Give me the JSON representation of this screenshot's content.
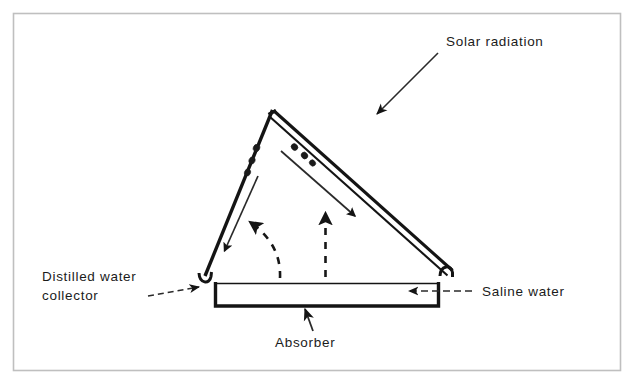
{
  "figure": {
    "kind": "technical-line-diagram",
    "background_color": "#ffffff",
    "ink_color": "#141414",
    "frame_color": "#bfbfbf",
    "width": 634,
    "height": 386
  },
  "labels": {
    "solar_radiation": "Solar radiation",
    "distilled_water_line1": "Distilled  water",
    "distilled_water_line2": "collector",
    "saline_water": "Saline water",
    "absorber": "Absorber"
  },
  "annotations": [
    {
      "name": "solar-radiation",
      "text": "Solar radiation",
      "text_x": 446,
      "text_y": 45,
      "leader": {
        "x1": 438,
        "y1": 53,
        "x2": 376,
        "y2": 115
      },
      "arrowhead": "end"
    },
    {
      "name": "distilled-water-collector",
      "text": "Distilled  water / collector",
      "text_x": 42,
      "text_y": 277,
      "leader": {
        "x1": 148,
        "y1": 295,
        "x2": 202,
        "y2": 285
      },
      "arrowhead": "end"
    },
    {
      "name": "saline-water",
      "text": "Saline water",
      "text_x": 481,
      "text_y": 295,
      "leader": {
        "x1": 470,
        "y1": 290,
        "x2": 410,
        "y2": 290
      },
      "arrowhead": "end"
    },
    {
      "name": "absorber",
      "text": "Absorber",
      "text_x": 276,
      "text_y": 342,
      "leader": {
        "x1": 312,
        "y1": 330,
        "x2": 306,
        "y2": 308
      },
      "arrowhead": "end"
    }
  ],
  "geometry": {
    "apex": {
      "x": 272,
      "y": 110
    },
    "left_slope_base": {
      "x": 205,
      "y": 276
    },
    "right_cover_base": {
      "x": 452,
      "y": 270
    },
    "basin": {
      "left_x": 215,
      "right_x": 438,
      "water_line_y": 283,
      "bottom_y": 306
    },
    "condensate_droplets_left": 3,
    "condensate_droplets_right": 3
  },
  "flows": [
    {
      "name": "condensate-runoff-left",
      "style": "solid-thin-arrow",
      "direction": "down-left"
    },
    {
      "name": "radiation-through-glass-right",
      "style": "solid-thin-arrow",
      "direction": "down-right"
    },
    {
      "name": "evaporation-left",
      "style": "dashed-arrow-curved",
      "direction": "up-left"
    },
    {
      "name": "evaporation-right",
      "style": "dashed-arrow-straight",
      "direction": "up"
    }
  ]
}
